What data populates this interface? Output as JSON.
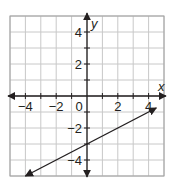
{
  "chart_data": {
    "type": "line",
    "title": "",
    "xlabel": "x",
    "ylabel": "y",
    "xlim": [
      -5,
      5
    ],
    "ylim": [
      -5,
      5
    ],
    "grid": true,
    "x_ticks": [
      -4,
      -2,
      0,
      2,
      4
    ],
    "x_tick_labels": [
      "−4",
      "−2",
      "0",
      "2",
      "4"
    ],
    "y_ticks": [
      4,
      2,
      -2,
      -4
    ],
    "y_tick_labels": [
      "4",
      "2",
      "−2",
      "−4"
    ],
    "series": [
      {
        "name": "line",
        "equation": "y = 0.5x - 3",
        "slope": 0.5,
        "intercept": -3,
        "x": [
          -4,
          4.5
        ],
        "y": [
          -5,
          -0.75
        ],
        "arrows": "both",
        "color": "#231f20"
      }
    ]
  },
  "colors": {
    "grid": "#c8c8c8",
    "axis": "#231f20",
    "border": "#a0a0a0"
  }
}
